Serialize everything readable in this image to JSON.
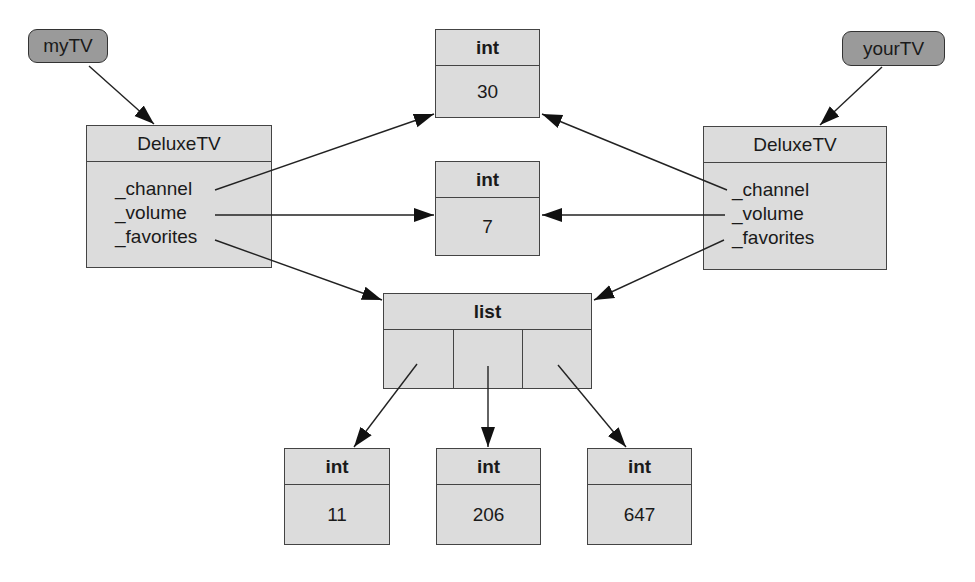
{
  "variables": [
    {
      "name": "myTV"
    },
    {
      "name": "yourTV"
    }
  ],
  "objects": {
    "left_tv": {
      "type": "DeluxeTV",
      "fields": [
        "_channel",
        "_volume",
        "_favorites"
      ]
    },
    "right_tv": {
      "type": "DeluxeTV",
      "fields": [
        "_channel",
        "_volume",
        "_favorites"
      ]
    },
    "int_channel": {
      "type": "int",
      "value": "30"
    },
    "int_volume": {
      "type": "int",
      "value": "7"
    },
    "list": {
      "type": "list",
      "cells": 3
    },
    "int_a": {
      "type": "int",
      "value": "11"
    },
    "int_b": {
      "type": "int",
      "value": "206"
    },
    "int_c": {
      "type": "int",
      "value": "647"
    }
  },
  "references": [
    {
      "from": "myTV",
      "to": "left_tv"
    },
    {
      "from": "yourTV",
      "to": "right_tv"
    },
    {
      "from": "left_tv._channel",
      "to": "int_channel"
    },
    {
      "from": "left_tv._volume",
      "to": "int_volume"
    },
    {
      "from": "left_tv._favorites",
      "to": "list"
    },
    {
      "from": "right_tv._channel",
      "to": "int_channel"
    },
    {
      "from": "right_tv._volume",
      "to": "int_volume"
    },
    {
      "from": "right_tv._favorites",
      "to": "list"
    },
    {
      "from": "list[0]",
      "to": "int_a"
    },
    {
      "from": "list[1]",
      "to": "int_b"
    },
    {
      "from": "list[2]",
      "to": "int_c"
    }
  ],
  "colors": {
    "variable_fill": "#9a9a9a",
    "object_fill": "#dcdcdc",
    "stroke": "#333333"
  }
}
